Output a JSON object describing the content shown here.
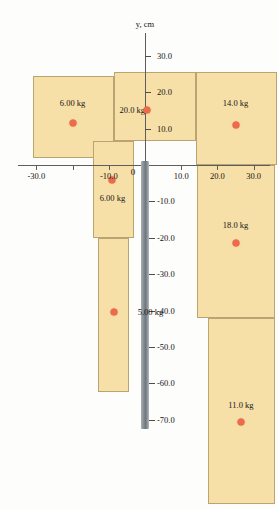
{
  "figure": {
    "axis_title_y": "y, cm",
    "origin_label": "0",
    "accent_com_color": "#ef6a4a",
    "block_fill_color": "#f7e0a8",
    "block_stroke_color": "#b9a472",
    "axis_color": "#5d5d5d",
    "y_negative_bar_color": "#7e868d"
  },
  "chart_data": {
    "type": "diagram",
    "title": "",
    "xlabel": "",
    "ylabel": "y, cm",
    "xlim": [
      -38,
      38
    ],
    "ylim": [
      -95,
      34
    ],
    "grid": false,
    "x_ticks": [
      -30.0,
      -20.0,
      -10.0,
      0.0,
      10.0,
      20.0,
      30.0
    ],
    "x_tick_labels": [
      "-30.0",
      "-20.0",
      "-10.0",
      "0",
      "10.0",
      "20.0",
      "30.0"
    ],
    "x_tick_labels_shown": [
      "-30.0",
      "-10.0",
      "0",
      "10.0",
      "20.0",
      "30.0"
    ],
    "y_ticks": [
      30.0,
      20.0,
      10.0,
      -10.0,
      -20.0,
      -30.0,
      -40.0,
      -50.0,
      -60.0,
      -70.0
    ],
    "y_tick_labels": [
      "30.0",
      "20.0",
      "10.0",
      "-10.0",
      "-20.0",
      "-30.0",
      "-40.0",
      "-50.0",
      "-60.0",
      "-70.0"
    ],
    "blocks": [
      {
        "id": "block-6kg-upper",
        "mass_label": "6.00 kg",
        "mass": 6.0,
        "x0": -31.0,
        "x1": -8.5,
        "y0": 2.0,
        "y1": 24.5,
        "label_x": -20.0,
        "label_y": 17.0,
        "com_x": -20.0,
        "com_y": 11.5
      },
      {
        "id": "block-20kg",
        "mass_label": "20.0 kg",
        "mass": 20.0,
        "x0": -8.5,
        "x1": 14.0,
        "y0": 6.5,
        "y1": 25.5,
        "label_x": -3.5,
        "label_y": 15.0,
        "com_x": 0.5,
        "com_y": 15.0
      },
      {
        "id": "block-14kg",
        "mass_label": "14.0 kg",
        "mass": 14.0,
        "x0": 14.0,
        "x1": 36.5,
        "y0": 0.0,
        "y1": 25.5,
        "label_x": 25.0,
        "label_y": 17.0,
        "com_x": 25.0,
        "com_y": 11.0
      },
      {
        "id": "block-6kg-lower",
        "mass_label": "6.00 kg",
        "mass": 6.0,
        "x0": -14.5,
        "x1": -3.0,
        "y0": -20.0,
        "y1": 6.5,
        "label_x": -9.0,
        "label_y": -9.0,
        "com_x": -9.0,
        "com_y": -4.0
      },
      {
        "id": "block-5kg",
        "mass_label": "5.00 kg",
        "mass": 5.0,
        "x0": -13.0,
        "x1": -4.5,
        "y0": -62.5,
        "y1": -20.0,
        "label_x": 1.5,
        "label_y": -40.5,
        "com_x": -8.5,
        "com_y": -40.5
      },
      {
        "id": "block-18kg",
        "mass_label": "18.0 kg",
        "mass": 18.0,
        "x0": 14.5,
        "x1": 36.0,
        "y0": -42.0,
        "y1": 0.0,
        "label_x": 25.0,
        "label_y": -16.5,
        "com_x": 25.0,
        "com_y": -21.5
      },
      {
        "id": "block-11kg",
        "mass_label": "11.0 kg",
        "mass": 11.0,
        "x0": 17.5,
        "x1": 36.0,
        "y0": -93.0,
        "y1": -42.0,
        "label_x": 26.5,
        "label_y": -66.0,
        "com_x": 26.5,
        "com_y": -70.5
      }
    ]
  }
}
